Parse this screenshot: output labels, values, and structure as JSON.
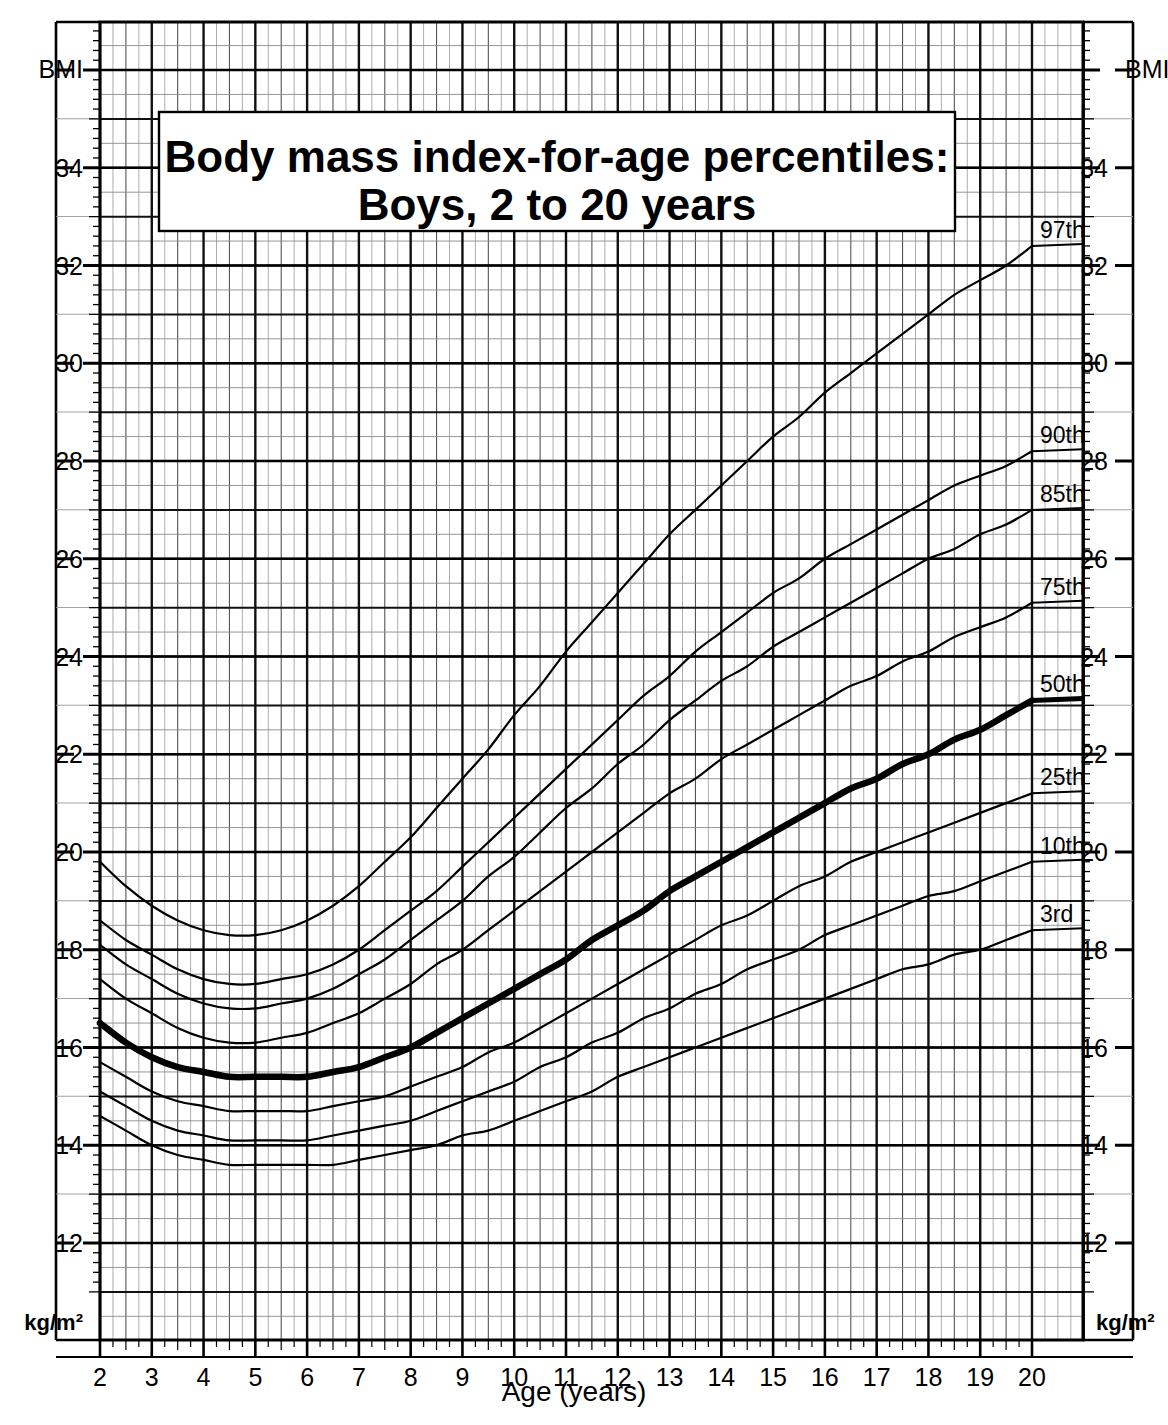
{
  "chart_data": {
    "type": "line",
    "title": "Body mass index-for-age percentiles:",
    "subtitle": "Boys, 2 to 20 years",
    "xlabel": "Age (years)",
    "ylabel": "BMI",
    "yunits": "kg/m²",
    "xlim": [
      2,
      20
    ],
    "ylim": [
      12,
      36
    ],
    "grid": true,
    "legend_position": "right-inline-labels",
    "xticks": [
      "2",
      "3",
      "4",
      "5",
      "6",
      "7",
      "8",
      "9",
      "10",
      "11",
      "12",
      "13",
      "14",
      "15",
      "16",
      "17",
      "18",
      "19",
      "20"
    ],
    "yticks": [
      "12",
      "14",
      "16",
      "18",
      "20",
      "22",
      "24",
      "26",
      "28",
      "30",
      "32",
      "34",
      "BMI"
    ],
    "ytick_values": [
      12,
      14,
      16,
      18,
      20,
      22,
      24,
      26,
      28,
      30,
      32,
      34,
      36
    ],
    "x": [
      2,
      2.5,
      3,
      3.5,
      4,
      4.5,
      5,
      5.5,
      6,
      6.5,
      7,
      7.5,
      8,
      8.5,
      9,
      9.5,
      10,
      10.5,
      11,
      11.5,
      12,
      12.5,
      13,
      13.5,
      14,
      14.5,
      15,
      15.5,
      16,
      16.5,
      17,
      17.5,
      18,
      18.5,
      19,
      19.5,
      20
    ],
    "series": [
      {
        "name": "97th",
        "label": "97th",
        "emphasis": false,
        "values": [
          19.8,
          19.3,
          18.9,
          18.6,
          18.4,
          18.3,
          18.3,
          18.4,
          18.6,
          18.9,
          19.3,
          19.8,
          20.3,
          20.9,
          21.5,
          22.1,
          22.8,
          23.4,
          24.1,
          24.7,
          25.3,
          25.9,
          26.5,
          27.0,
          27.5,
          28.0,
          28.5,
          28.9,
          29.4,
          29.8,
          30.2,
          30.6,
          31.0,
          31.4,
          31.7,
          32.0,
          32.4
        ]
      },
      {
        "name": "90th",
        "label": "90th",
        "emphasis": false,
        "values": [
          18.6,
          18.2,
          17.9,
          17.6,
          17.4,
          17.3,
          17.3,
          17.4,
          17.5,
          17.7,
          18.0,
          18.4,
          18.8,
          19.2,
          19.7,
          20.2,
          20.7,
          21.2,
          21.7,
          22.2,
          22.7,
          23.2,
          23.6,
          24.1,
          24.5,
          24.9,
          25.3,
          25.6,
          26.0,
          26.3,
          26.6,
          26.9,
          27.2,
          27.5,
          27.7,
          27.9,
          28.2
        ]
      },
      {
        "name": "85th",
        "label": "85th",
        "emphasis": false,
        "values": [
          18.1,
          17.7,
          17.4,
          17.1,
          16.9,
          16.8,
          16.8,
          16.9,
          17.0,
          17.2,
          17.5,
          17.8,
          18.2,
          18.6,
          19.0,
          19.5,
          19.9,
          20.4,
          20.9,
          21.3,
          21.8,
          22.2,
          22.7,
          23.1,
          23.5,
          23.8,
          24.2,
          24.5,
          24.8,
          25.1,
          25.4,
          25.7,
          26.0,
          26.2,
          26.5,
          26.7,
          27.0
        ]
      },
      {
        "name": "75th",
        "label": "75th",
        "emphasis": false,
        "values": [
          17.4,
          17.0,
          16.7,
          16.4,
          16.2,
          16.1,
          16.1,
          16.2,
          16.3,
          16.5,
          16.7,
          17.0,
          17.3,
          17.7,
          18.0,
          18.4,
          18.8,
          19.2,
          19.6,
          20.0,
          20.4,
          20.8,
          21.2,
          21.5,
          21.9,
          22.2,
          22.5,
          22.8,
          23.1,
          23.4,
          23.6,
          23.9,
          24.1,
          24.4,
          24.6,
          24.8,
          25.1
        ]
      },
      {
        "name": "50th",
        "label": "50th",
        "emphasis": true,
        "values": [
          16.5,
          16.1,
          15.8,
          15.6,
          15.5,
          15.4,
          15.4,
          15.4,
          15.4,
          15.5,
          15.6,
          15.8,
          16.0,
          16.3,
          16.6,
          16.9,
          17.2,
          17.5,
          17.8,
          18.2,
          18.5,
          18.8,
          19.2,
          19.5,
          19.8,
          20.1,
          20.4,
          20.7,
          21.0,
          21.3,
          21.5,
          21.8,
          22.0,
          22.3,
          22.5,
          22.8,
          23.1
        ]
      },
      {
        "name": "25th",
        "label": "25th",
        "emphasis": false,
        "values": [
          15.7,
          15.4,
          15.1,
          14.9,
          14.8,
          14.7,
          14.7,
          14.7,
          14.7,
          14.8,
          14.9,
          15.0,
          15.2,
          15.4,
          15.6,
          15.9,
          16.1,
          16.4,
          16.7,
          17.0,
          17.3,
          17.6,
          17.9,
          18.2,
          18.5,
          18.7,
          19.0,
          19.3,
          19.5,
          19.8,
          20.0,
          20.2,
          20.4,
          20.6,
          20.8,
          21.0,
          21.2
        ]
      },
      {
        "name": "10th",
        "label": "10th",
        "emphasis": false,
        "values": [
          15.1,
          14.8,
          14.5,
          14.3,
          14.2,
          14.1,
          14.1,
          14.1,
          14.1,
          14.2,
          14.3,
          14.4,
          14.5,
          14.7,
          14.9,
          15.1,
          15.3,
          15.6,
          15.8,
          16.1,
          16.3,
          16.6,
          16.8,
          17.1,
          17.3,
          17.6,
          17.8,
          18.0,
          18.3,
          18.5,
          18.7,
          18.9,
          19.1,
          19.2,
          19.4,
          19.6,
          19.8
        ]
      },
      {
        "name": "3rd",
        "label": "3rd",
        "emphasis": false,
        "values": [
          14.6,
          14.3,
          14.0,
          13.8,
          13.7,
          13.6,
          13.6,
          13.6,
          13.6,
          13.6,
          13.7,
          13.8,
          13.9,
          14.0,
          14.2,
          14.3,
          14.5,
          14.7,
          14.9,
          15.1,
          15.4,
          15.6,
          15.8,
          16.0,
          16.2,
          16.4,
          16.6,
          16.8,
          17.0,
          17.2,
          17.4,
          17.6,
          17.7,
          17.9,
          18.0,
          18.2,
          18.4
        ]
      }
    ]
  },
  "labels": {
    "y_left_top": "BMI",
    "y_right_top": "BMI",
    "y_left_units": "kg/m²",
    "y_right_units": "kg/m²",
    "x_axis_title": "Age (years)"
  },
  "colors": {
    "ink": "#000000",
    "grid_major": "#1a1a1a",
    "grid_minor": "#8a8a8a",
    "background": "#ffffff"
  }
}
